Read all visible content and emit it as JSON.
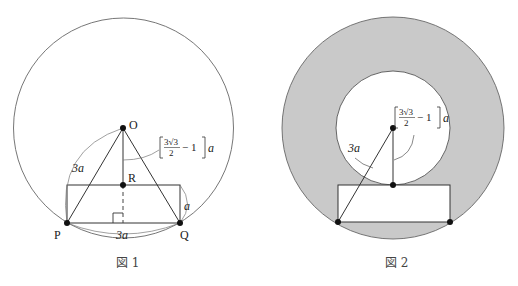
{
  "figure1": {
    "caption": "図 1",
    "points": {
      "O": {
        "label": "O",
        "x": 123,
        "y": 128
      },
      "R": {
        "label": "R",
        "x": 123,
        "y": 185
      },
      "P": {
        "label": "P",
        "x": 67,
        "y": 223
      },
      "Q": {
        "label": "Q",
        "x": 180,
        "y": 223
      }
    },
    "circle": {
      "cx": 123.5,
      "cy": 128,
      "r": 110
    },
    "rectangle": {
      "x": 67,
      "y": 185,
      "width": 113,
      "height": 38
    },
    "labels": {
      "op_length": "3a",
      "pq_length": "3a",
      "rect_height": "a",
      "or_length_prefix": "3√3",
      "or_length_denom": "2",
      "or_length_suffix": "− 1",
      "or_length_var": "a"
    }
  },
  "figure2": {
    "caption": "図 2",
    "outer_circle": {
      "cx": 393,
      "cy": 128,
      "r": 111
    },
    "inner_circle": {
      "cx": 393,
      "cy": 128,
      "r": 57
    },
    "rectangle": {
      "x": 338,
      "y": 185,
      "width": 112,
      "height": 37
    },
    "labels": {
      "slant_length": "3a",
      "radius_prefix": "3√3",
      "radius_denom": "2",
      "radius_suffix": "− 1",
      "radius_var": "a"
    },
    "shade_color": "#c9c9c9"
  }
}
